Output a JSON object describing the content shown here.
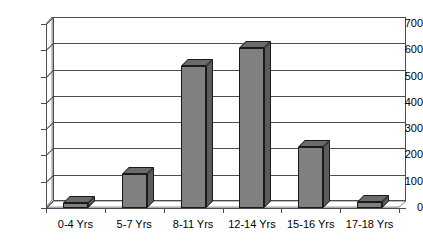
{
  "chart_data": {
    "type": "bar",
    "title": "",
    "subtitle": "",
    "xlabel": "",
    "ylabel": "",
    "categories": [
      "0-4 Yrs",
      "5-7 Yrs",
      "8-11 Yrs",
      "12-14 Yrs",
      "15-16 Yrs",
      "17-18 Yrs"
    ],
    "values": [
      20,
      130,
      540,
      610,
      232,
      22
    ],
    "ylim": [
      0,
      700
    ],
    "ytick_step": 100,
    "yticks": [
      0,
      100,
      200,
      300,
      400,
      500,
      600,
      700
    ],
    "ytick_labels": [
      "0",
      "100",
      "200",
      "300",
      "400",
      "500",
      "600",
      "700"
    ],
    "grid": "horizontal",
    "legend": "none",
    "style": "3d-column",
    "series": [
      {
        "name": "Series 1",
        "values": [
          20,
          130,
          540,
          610,
          232,
          22
        ]
      }
    ]
  },
  "colors": {
    "bar_face": "#808080",
    "bar_side": "#5c5c5c",
    "bar_top": "#6b6b6b",
    "bar_outline": "#1a1a1a",
    "axis": "#4d4d4d",
    "gridline": "#4d4d4d",
    "background": "#ffffff",
    "text": "#000000"
  }
}
